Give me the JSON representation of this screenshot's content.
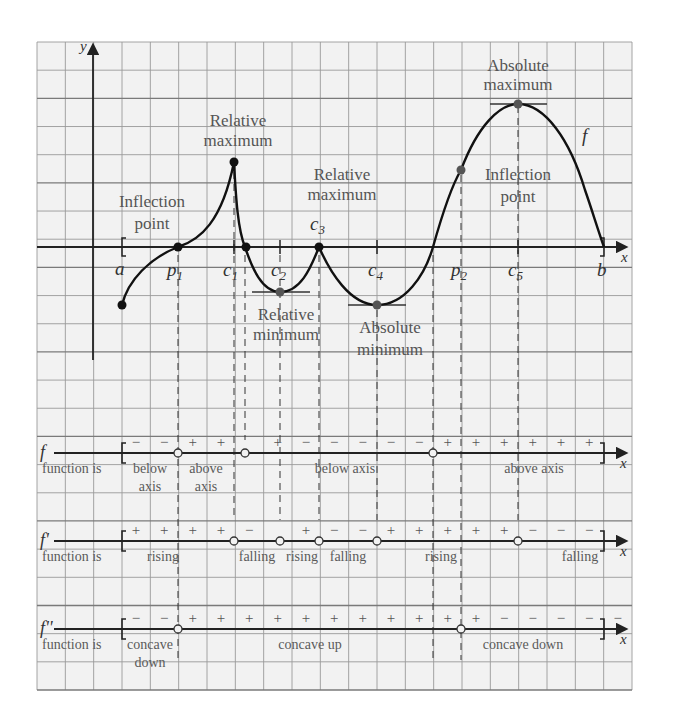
{
  "figure": {
    "grid": {
      "left": 37,
      "top": 42,
      "right": 632,
      "bottom": 690,
      "cell": 28.33,
      "cols": 21,
      "rows": 23,
      "background": "#f2f2f2",
      "line_color": "#9a9a9a",
      "heavy_line_color": "#7a7a7a"
    },
    "colors": {
      "curve": "#111111",
      "axis": "#222222",
      "text": "#555555",
      "dashed": "#333333",
      "point_gray": "#555555"
    },
    "axes": {
      "y_label": "y",
      "x_label": "x",
      "origin_x": 93,
      "axis_y": 247,
      "y_axis_top": 45,
      "y_axis_bottom": 360,
      "x_axis_left": 37,
      "x_axis_right": 626
    }
  },
  "points": {
    "a": {
      "label": "a",
      "x": 122
    },
    "p1": {
      "label": "p",
      "sub": "1",
      "x": 178
    },
    "c1": {
      "label": "c",
      "sub": "1",
      "x": 234
    },
    "c2": {
      "label": "c",
      "sub": "2",
      "x": 280
    },
    "c3": {
      "label": "c",
      "sub": "3",
      "x": 319
    },
    "c4": {
      "label": "c",
      "sub": "4",
      "x": 377
    },
    "p2": {
      "label": "p",
      "sub": "2",
      "x": 461
    },
    "c5": {
      "label": "c",
      "sub": "5",
      "x": 518
    },
    "b": {
      "label": "b",
      "x": 604
    }
  },
  "annotations": {
    "relative_maximum_1": {
      "line1": "Relative",
      "line2": "maximum"
    },
    "relative_maximum_2": {
      "line1": "Relative",
      "line2": "maximum"
    },
    "absolute_maximum": {
      "line1": "Absolute",
      "line2": "maximum"
    },
    "inflection_point_1": {
      "line1": "Inflection",
      "line2": "point"
    },
    "inflection_point_2": {
      "line1": "Inflection",
      "line2": "point"
    },
    "relative_minimum": {
      "line1": "Relative",
      "line2": "minimum"
    },
    "absolute_minimum": {
      "line1": "Absolute",
      "line2": "minimum"
    },
    "curve_label": "f"
  },
  "sign_charts": [
    {
      "name": "f",
      "label": "f",
      "row_label": "function is",
      "signs": [
        "−",
        "−",
        "+",
        "+",
        "",
        "+",
        "−",
        "−",
        "−",
        "−",
        "−",
        "+",
        "+",
        "+",
        "+",
        "+",
        "+"
      ],
      "descriptions": [
        {
          "text": "below",
          "text2": "axis",
          "x": 150
        },
        {
          "text": "above",
          "text2": "axis",
          "x": 206
        },
        {
          "text": "below axis",
          "x": 345
        },
        {
          "text": "above axis",
          "x": 534
        }
      ]
    },
    {
      "name": "f-prime",
      "label": "f'",
      "row_label": "function is",
      "signs": [
        "+",
        "+",
        "+",
        "+",
        "−",
        "",
        "+",
        "−",
        "−",
        "+",
        "+",
        "+",
        "+",
        "+",
        "−",
        "−",
        "−"
      ],
      "descriptions": [
        {
          "text": "rising",
          "x": 163
        },
        {
          "text": "falling",
          "x": 257
        },
        {
          "text": "rising",
          "x": 302
        },
        {
          "text": "falling",
          "x": 348
        },
        {
          "text": "rising",
          "x": 441
        },
        {
          "text": "falling",
          "x": 580
        }
      ]
    },
    {
      "name": "f-double-prime",
      "label": "f''",
      "row_label": "function is",
      "signs": [
        "−",
        "−",
        "+",
        "+",
        "+",
        "+",
        "+",
        "+",
        "+",
        "+",
        "+",
        "+",
        "+",
        "−",
        "−",
        "−",
        "−",
        "−"
      ],
      "descriptions": [
        {
          "text": "concave",
          "text2": "down",
          "x": 150
        },
        {
          "text": "concave up",
          "x": 310
        },
        {
          "text": "concave down",
          "x": 523
        }
      ]
    }
  ],
  "chart_data": {
    "type": "line",
    "title": "",
    "xlabel": "x",
    "ylabel": "y",
    "series": [
      {
        "name": "f",
        "points": [
          {
            "x": "a",
            "y": -2,
            "note": "endpoint"
          },
          {
            "x": "p1",
            "y": 0,
            "note": "inflection point"
          },
          {
            "x": "c1",
            "y": 3,
            "note": "relative maximum (cusp)"
          },
          {
            "x": "c2",
            "y": -1.5,
            "note": "relative minimum"
          },
          {
            "x": "c3",
            "y": 0,
            "note": "relative maximum (cusp)"
          },
          {
            "x": "c4",
            "y": -2,
            "note": "absolute minimum"
          },
          {
            "x": "p2",
            "y": 2.7,
            "note": "inflection point"
          },
          {
            "x": "c5",
            "y": 5,
            "note": "absolute maximum"
          },
          {
            "x": "b",
            "y": 0,
            "note": "endpoint"
          }
        ]
      }
    ],
    "sign_rows": [
      "f",
      "f'",
      "f''"
    ]
  }
}
